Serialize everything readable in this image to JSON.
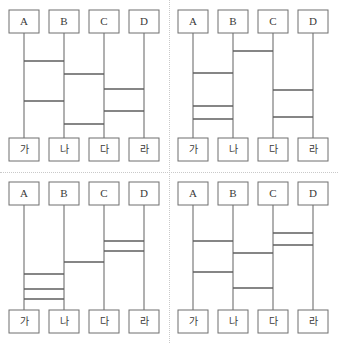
{
  "page": {
    "background_color": "#ffffff",
    "line_color": "#6f6f6f",
    "divider_color": "#c9c9c9",
    "width": 338,
    "height": 343
  },
  "geometry": {
    "rail_x": [
      24,
      64,
      104,
      144
    ],
    "box_width": 30,
    "box_height": 23,
    "top_box_y": 10,
    "bottom_box_y": 138,
    "rail_top_y": 33,
    "rail_bottom_y": 138
  },
  "top_labels": [
    "A",
    "B",
    "C",
    "D"
  ],
  "bottom_labels": [
    "가",
    "나",
    "다",
    "라"
  ],
  "chart_data": {
    "type": "diagram",
    "subtype": "ladder-lottery",
    "panel_count": 4,
    "columns": [
      "A",
      "B",
      "C",
      "D"
    ],
    "outcomes": [
      "가",
      "나",
      "다",
      "라"
    ],
    "panels": [
      {
        "id": "top-left",
        "label": "1",
        "rungs": [
          {
            "from": 0,
            "to": 1,
            "y": 61
          },
          {
            "from": 1,
            "to": 2,
            "y": 74
          },
          {
            "from": 2,
            "to": 3,
            "y": 89
          },
          {
            "from": 0,
            "to": 1,
            "y": 101
          },
          {
            "from": 2,
            "to": 3,
            "y": 111
          },
          {
            "from": 1,
            "to": 2,
            "y": 124
          }
        ]
      },
      {
        "id": "top-right",
        "label": "2",
        "rungs": [
          {
            "from": 1,
            "to": 2,
            "y": 51
          },
          {
            "from": 0,
            "to": 1,
            "y": 73
          },
          {
            "from": 2,
            "to": 3,
            "y": 90
          },
          {
            "from": 0,
            "to": 1,
            "y": 106
          },
          {
            "from": 2,
            "to": 3,
            "y": 117
          },
          {
            "from": 0,
            "to": 1,
            "y": 119
          }
        ]
      },
      {
        "id": "bottom-left",
        "label": "3",
        "rungs": [
          {
            "from": 2,
            "to": 3,
            "y": 69
          },
          {
            "from": 2,
            "to": 3,
            "y": 79
          },
          {
            "from": 1,
            "to": 2,
            "y": 90
          },
          {
            "from": 0,
            "to": 1,
            "y": 102
          },
          {
            "from": 0,
            "to": 1,
            "y": 117
          },
          {
            "from": 0,
            "to": 1,
            "y": 127
          }
        ]
      },
      {
        "id": "bottom-right",
        "label": "4",
        "rungs": [
          {
            "from": 2,
            "to": 3,
            "y": 61
          },
          {
            "from": 0,
            "to": 1,
            "y": 69
          },
          {
            "from": 2,
            "to": 3,
            "y": 73
          },
          {
            "from": 1,
            "to": 2,
            "y": 81
          },
          {
            "from": 0,
            "to": 1,
            "y": 100
          },
          {
            "from": 1,
            "to": 2,
            "y": 116
          }
        ]
      }
    ]
  }
}
